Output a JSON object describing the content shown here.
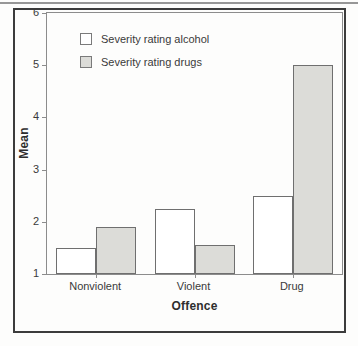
{
  "chart_data": {
    "type": "bar",
    "title": "",
    "xlabel": "Offence",
    "ylabel": "Mean",
    "categories": [
      "Nonviolent",
      "Violent",
      "Drug"
    ],
    "series": [
      {
        "name": "Severity rating alcohol",
        "fill": "#ffffff",
        "values": [
          1.5,
          2.25,
          2.5
        ]
      },
      {
        "name": "Severity rating drugs",
        "fill": "#dcdcd8",
        "values": [
          1.9,
          1.55,
          5.0
        ]
      }
    ],
    "ylim": [
      1,
      6
    ],
    "yticks": [
      1,
      2,
      3,
      4,
      5,
      6
    ],
    "grid": false,
    "legend_position": "top-left-inside",
    "bar_width_px": 40
  },
  "colors": {
    "bar_outline": "#6f6f6f",
    "axis_box": "#8c8c8c",
    "figure_frame": "#3c3c3c",
    "top_rule": "#979797",
    "text": "#3a3a3a"
  }
}
